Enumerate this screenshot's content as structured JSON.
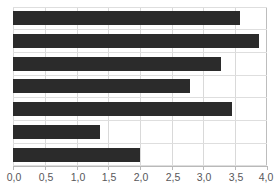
{
  "chart_data": {
    "type": "bar",
    "orientation": "horizontal",
    "title": "",
    "subtitle": "",
    "xlabel": "",
    "ylabel": "",
    "categories": [
      "1",
      "2",
      "3",
      "4",
      "5",
      "6",
      "7"
    ],
    "values": [
      3.58,
      3.87,
      3.28,
      2.78,
      3.45,
      1.37,
      2.0
    ],
    "xlim": [
      0.0,
      4.0
    ],
    "xticks": [
      0.0,
      0.5,
      1.0,
      1.5,
      2.0,
      2.5,
      3.0,
      3.5,
      4.0
    ],
    "xtick_labels": [
      "0,0",
      "0,5",
      "1,0",
      "1,5",
      "2,0",
      "2,5",
      "3,0",
      "3,5",
      "4,0"
    ],
    "decimal_separator": ",",
    "grid": {
      "vertical": true,
      "horizontal": true
    },
    "legend": {
      "visible": false,
      "position": "none"
    },
    "series": [
      {
        "name": "",
        "values": [
          3.58,
          3.87,
          3.28,
          2.78,
          3.45,
          1.37,
          2.0
        ]
      }
    ],
    "annotations": [],
    "colors": {
      "bar": "#2b2b2b",
      "grid": "#d9d9d9",
      "grid_horizontal": "#dedede",
      "axis": "#b9b9b9",
      "tick_label": "#58585a",
      "plot_background": "#ffffff"
    }
  }
}
